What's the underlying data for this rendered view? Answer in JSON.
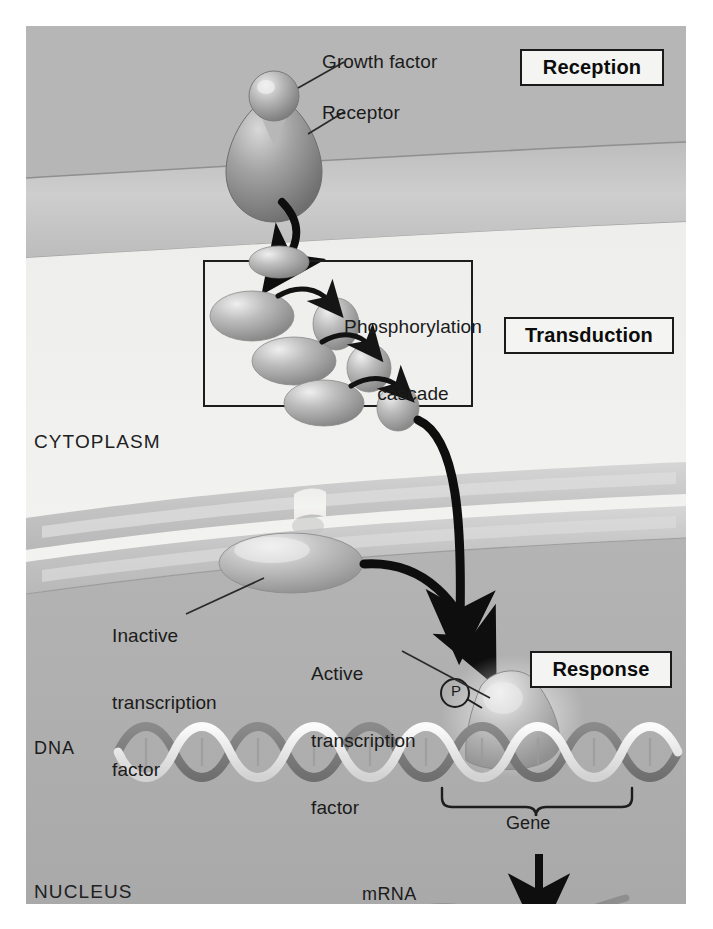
{
  "figure": {
    "stage_boxes": [
      {
        "id": "reception",
        "label": "Reception"
      },
      {
        "id": "transduction",
        "label": "Transduction"
      },
      {
        "id": "response",
        "label": "Response"
      }
    ],
    "compartments": [
      {
        "id": "cytoplasm",
        "label": "CYTOPLASM"
      },
      {
        "id": "nucleus",
        "label": "NUCLEUS"
      }
    ],
    "callouts": [
      {
        "id": "growth-factor",
        "label": "Growth factor"
      },
      {
        "id": "receptor",
        "label": "Receptor"
      },
      {
        "id": "phosphorylation-cascade",
        "line1": "Phosphorylation",
        "line2": "cascade"
      },
      {
        "id": "inactive-transcription-factor",
        "line1": "Inactive",
        "line2": "transcription",
        "line3": "factor"
      },
      {
        "id": "active-transcription-factor",
        "line1": "Active",
        "line2": "transcription",
        "line3": "factor"
      }
    ],
    "structures": [
      {
        "id": "dna",
        "label": "DNA"
      },
      {
        "id": "gene",
        "label": "Gene"
      },
      {
        "id": "mrna",
        "label": "mRNA"
      },
      {
        "id": "phosphate",
        "label": "P"
      }
    ],
    "colors": {
      "extracellular": "#b6b6b6",
      "membrane_band": "#c6c6c6",
      "cytoplasm": "#f1f1ef",
      "nuclear_envelope": "#c9c9c9",
      "nucleoplasm": "#b0b0b0",
      "protein_fill": "#9a9a9a",
      "protein_highlight": "#e4e4e4",
      "arrow": "#0e0e0e",
      "text": "#1b1b1b",
      "box_border": "#1a1a1a",
      "box_fill": "#f4f4f2",
      "dna_strand": "#8d8d8d",
      "dna_highlight": "#f0f0f0"
    }
  }
}
